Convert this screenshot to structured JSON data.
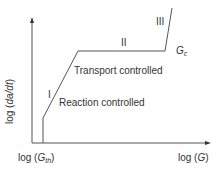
{
  "diagram": {
    "y_axis_label": {
      "prefix": "log (",
      "var": "da/dt",
      "suffix": ")"
    },
    "x_axis_label": {
      "prefix": "log (",
      "var": "G",
      "suffix": ")"
    },
    "x_threshold_label": {
      "prefix": "log (",
      "var": "G",
      "sub": "th",
      "suffix": ")"
    },
    "critical_label": {
      "var": "G",
      "sub": "c"
    },
    "regions": [
      {
        "numeral": "I",
        "description": "Reaction controlled"
      },
      {
        "numeral": "II",
        "description": "Transport controlled"
      },
      {
        "numeral": "III",
        "description": ""
      }
    ],
    "colors": {
      "line": "#555555",
      "text": "#333333"
    }
  }
}
